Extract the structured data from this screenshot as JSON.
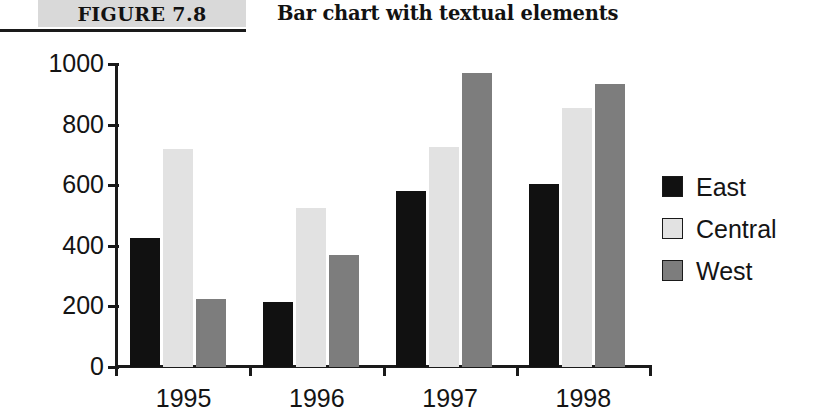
{
  "header": {
    "figure_number": "FIGURE 7.8",
    "figure_title": "Bar chart with textual elements"
  },
  "chart_data": {
    "type": "bar",
    "title": "Bar chart with textual elements",
    "xlabel": "",
    "ylabel": "",
    "categories": [
      "1995",
      "1996",
      "1997",
      "1998"
    ],
    "series": [
      {
        "name": "East",
        "color": "#111111",
        "values": [
          425,
          215,
          580,
          605
        ]
      },
      {
        "name": "Central",
        "color": "#e2e2e2",
        "values": [
          720,
          525,
          725,
          855
        ]
      },
      {
        "name": "West",
        "color": "#7d7d7d",
        "values": [
          225,
          370,
          970,
          935
        ]
      }
    ],
    "ylim": [
      0,
      1000
    ],
    "yticks": [
      0,
      200,
      400,
      600,
      800,
      1000
    ],
    "ytick_labels": [
      "0",
      "200",
      "400",
      "600",
      "800",
      "1000"
    ],
    "grid": false,
    "legend_position": "right",
    "legend_entries": [
      "East",
      "Central",
      "West"
    ]
  }
}
